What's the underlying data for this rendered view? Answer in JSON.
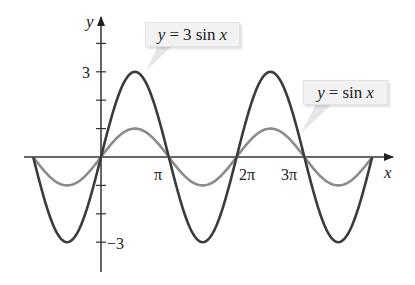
{
  "chart_data": {
    "type": "line",
    "title": "",
    "xlabel": "x",
    "ylabel": "y",
    "x_range": [
      -3.14159,
      12.56637
    ],
    "xlim": [
      -3.14159,
      13.5
    ],
    "ylim": [
      -4,
      4.5
    ],
    "x_tick_labels": [
      "π",
      "2π",
      "3π"
    ],
    "x_tick_values": [
      3.14159,
      6.28318,
      9.42478
    ],
    "y_tick_values": [
      -3,
      -2,
      -1,
      1,
      2,
      3,
      4
    ],
    "y_tick_labels": {
      "3": "3",
      "-3": "−3"
    },
    "grid": false,
    "legend": "callouts",
    "series": [
      {
        "name": "y = 3 sin x",
        "function": "3*sin(x)",
        "amplitude": 3,
        "color": "#3b3b3b",
        "x": [
          -3.1416,
          -2.3562,
          -1.5708,
          -0.7854,
          0,
          0.7854,
          1.5708,
          2.3562,
          3.1416,
          3.927,
          4.7124,
          5.4978,
          6.2832,
          7.0686,
          7.854,
          8.6394,
          9.4248,
          10.2102,
          10.9956,
          11.781,
          12.5664
        ],
        "values": [
          0,
          -2.12,
          -3,
          -2.12,
          0,
          2.12,
          3,
          2.12,
          0,
          -2.12,
          -3,
          -2.12,
          0,
          2.12,
          3,
          2.12,
          0,
          -2.12,
          -3,
          -2.12,
          0
        ]
      },
      {
        "name": "y = sin x",
        "function": "sin(x)",
        "amplitude": 1,
        "color": "#8c8c8c",
        "x": [
          -3.1416,
          -2.3562,
          -1.5708,
          -0.7854,
          0,
          0.7854,
          1.5708,
          2.3562,
          3.1416,
          3.927,
          4.7124,
          5.4978,
          6.2832,
          7.0686,
          7.854,
          8.6394,
          9.4248,
          10.2102,
          10.9956,
          11.781,
          12.5664
        ],
        "values": [
          0,
          -0.71,
          -1,
          -0.71,
          0,
          0.71,
          1,
          0.71,
          0,
          -0.71,
          -1,
          -0.71,
          0,
          0.71,
          1,
          0.71,
          0,
          -0.71,
          -1,
          -0.71,
          0
        ]
      }
    ],
    "annotations": [
      {
        "text": "y = 3 sin x",
        "points_to": "peak of 3 sin x near x = π/2"
      },
      {
        "text": "y = sin x",
        "points_to": "sin x near x = 3π"
      }
    ]
  },
  "labels": {
    "y_axis": "y",
    "x_axis": "x",
    "tick_pi": "π",
    "tick_2pi": "2π",
    "tick_3pi": "3π",
    "tick_3": "3",
    "tick_neg3": "−3",
    "callout_3sin": {
      "y": "y",
      "eq": "=",
      "rest": "3 sin",
      "x": "x"
    },
    "callout_sin": {
      "y": "y",
      "eq": "=",
      "rest": "sin",
      "x": "x"
    }
  },
  "layout": {
    "origin_x": 101,
    "origin_y": 157,
    "px_per_pi": 67.8,
    "px_per_unit_y": 28.4,
    "axis_color": "#333333"
  }
}
